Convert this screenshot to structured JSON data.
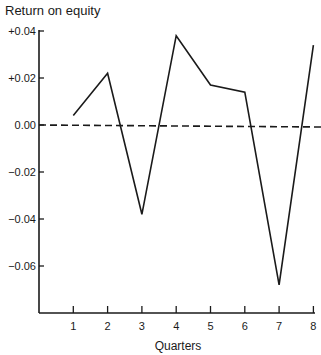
{
  "chart_data": {
    "type": "line",
    "title": "Return on equity",
    "xlabel": "Quarters",
    "ylabel": "Return on equity",
    "categories": [
      "1",
      "2",
      "3",
      "4",
      "5",
      "6",
      "7",
      "8"
    ],
    "x": [
      1,
      2,
      3,
      4,
      5,
      6,
      7,
      8
    ],
    "series": [
      {
        "name": "Return on equity",
        "values": [
          0.004,
          0.022,
          -0.038,
          0.038,
          0.017,
          0.014,
          -0.068,
          0.034
        ]
      }
    ],
    "reference_line": {
      "y": 0.0,
      "style": "dashed"
    },
    "yticks": [
      "+0.04",
      "+0.02",
      "0.00",
      "−0.02",
      "−0.04",
      "−0.06"
    ],
    "ytick_values": [
      0.04,
      0.02,
      0.0,
      -0.02,
      -0.04,
      -0.06
    ],
    "xticks": [
      "1",
      "2",
      "3",
      "4",
      "5",
      "6",
      "7",
      "8"
    ],
    "ylim": [
      -0.081,
      0.042
    ],
    "xlim": [
      0,
      8
    ],
    "grid": false,
    "legend": null
  }
}
